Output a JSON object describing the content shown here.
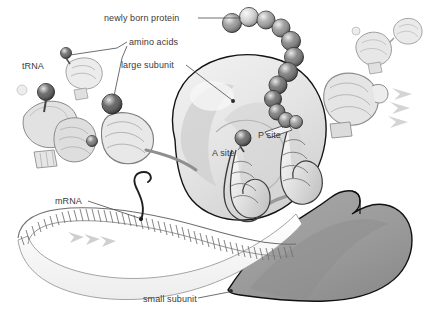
{
  "figure": {
    "background_color": "#ffffff",
    "label_color": "#3a3a3a",
    "leader_line_color": "#555555"
  },
  "labels": {
    "newly_born_protein": "newly born protein",
    "amino_acids": "amino acids",
    "large_subunit": "large subunit",
    "trna": "tRNA",
    "a_site": "A site",
    "p_site": "P site",
    "mrna": "mRNA",
    "small_subunit": "small subunit"
  },
  "structures": {
    "large_subunit": {
      "name": "large subunit",
      "fill": "#e6e6e6",
      "stroke": "#1a1a1a"
    },
    "small_subunit": {
      "name": "small subunit",
      "fill": "#9c9c9c",
      "stroke": "#1a1a1a"
    },
    "mrna": {
      "name": "mRNA strand",
      "fill": "#fbfbfb",
      "stroke": "#6b6b6b",
      "rung_count": 62
    },
    "trna_free": {
      "name": "free tRNA with amino acid",
      "fill": "#dcdcdc",
      "stroke": "#777777"
    },
    "trna_a_site": {
      "name": "tRNA in A site",
      "fill": "#efefef",
      "stroke": "#444444"
    },
    "trna_p_site": {
      "name": "tRNA in P site",
      "fill": "#efefef",
      "stroke": "#444444"
    },
    "trna_exiting": {
      "name": "exiting tRNA",
      "fill": "#e4e4e4",
      "stroke": "#8a8a8a"
    },
    "motion_arrows": {
      "name": "motion chevrons",
      "fill": "#d2d2d2"
    }
  },
  "protein_chain": {
    "name": "newly born polypeptide chain",
    "bead_count": 12,
    "beads": [
      {
        "cx": 232,
        "cy": 23,
        "r": 9.5,
        "shade": "#8f8f8f"
      },
      {
        "cx": 249,
        "cy": 17,
        "r": 9.5,
        "shade": "#cfcfcf"
      },
      {
        "cx": 266,
        "cy": 20,
        "r": 9.0,
        "shade": "#9b9b9b"
      },
      {
        "cx": 281,
        "cy": 28,
        "r": 9.0,
        "shade": "#8a8a8a"
      },
      {
        "cx": 291,
        "cy": 41,
        "r": 9.5,
        "shade": "#787878"
      },
      {
        "cx": 294,
        "cy": 57,
        "r": 9.5,
        "shade": "#6f6f6f"
      },
      {
        "cx": 288,
        "cy": 72,
        "r": 9.5,
        "shade": "#6a6a6a"
      },
      {
        "cx": 278,
        "cy": 85,
        "r": 9.0,
        "shade": "#636363"
      },
      {
        "cx": 273,
        "cy": 99,
        "r": 8.5,
        "shade": "#5e5e5e"
      },
      {
        "cx": 277,
        "cy": 112,
        "r": 8.0,
        "shade": "#6d6d6d"
      },
      {
        "cx": 286,
        "cy": 120,
        "r": 7.5,
        "shade": "#7d7d7d"
      },
      {
        "cx": 296,
        "cy": 122,
        "r": 6.5,
        "shade": "#8d8d8d"
      }
    ]
  },
  "amino_acid_spheres": [
    {
      "name": "amino-acid-on-free-trna-upper",
      "cx": 66,
      "cy": 53,
      "r": 5.5,
      "shade": "#5a5a5a"
    },
    {
      "name": "amino-acid-on-free-trna-lower",
      "cx": 46,
      "cy": 92,
      "r": 8.5,
      "shade": "#4e4e4e"
    },
    {
      "name": "amino-acid-incoming",
      "cx": 112,
      "cy": 104,
      "r": 10.0,
      "shade": "#4a4a4a"
    },
    {
      "name": "amino-acid-left-loose",
      "cx": 92,
      "cy": 141,
      "r": 5.5,
      "shade": "#6d6d6d"
    },
    {
      "name": "amino-acid-a-site",
      "cx": 243,
      "cy": 138,
      "r": 8.0,
      "shade": "#5a5a5a"
    }
  ],
  "leader_lines": [
    {
      "name": "leader-newly-born-protein",
      "points": "198,18 241,18"
    },
    {
      "name": "leader-amino-acids-to-upper",
      "points": "127,42 117,48 70,55"
    },
    {
      "name": "leader-amino-acids-to-lower",
      "points": "127,46 122,58 114,96"
    },
    {
      "name": "leader-large-subunit",
      "points": "186,65 232,100"
    },
    {
      "name": "leader-a-site",
      "points": "238,150 242,144"
    },
    {
      "name": "leader-p-site",
      "points": "282,128 276,118"
    },
    {
      "name": "leader-mrna",
      "points": "88,201 139,218"
    },
    {
      "name": "leader-small-subunit",
      "points": "198,298 228,292"
    }
  ]
}
